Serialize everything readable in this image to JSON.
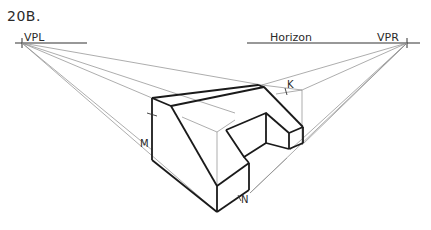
{
  "figure": {
    "title": "20B.",
    "labels": {
      "vpl": "VPL",
      "vpr": "VPR",
      "horizon": "Horizon",
      "m": "M",
      "k": "K",
      "n": "N"
    },
    "colors": {
      "object_line": "#1a1a1a",
      "construction_line": "#8a8a8a",
      "horizon_line": "#333333"
    }
  }
}
